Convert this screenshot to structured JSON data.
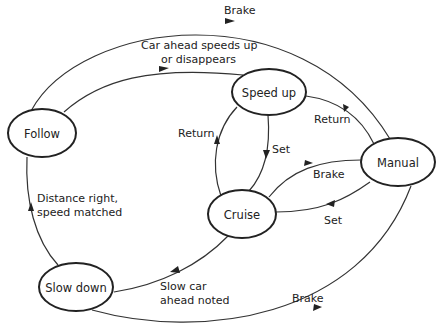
{
  "diagram": {
    "type": "state-transition",
    "nodes": {
      "follow": {
        "label": "Follow"
      },
      "speed_up": {
        "label": "Speed up"
      },
      "manual": {
        "label": "Manual"
      },
      "cruise": {
        "label": "Cruise"
      },
      "slow_down": {
        "label": "Slow down"
      }
    },
    "edges": {
      "follow_to_manual": {
        "label": "Brake"
      },
      "follow_to_speed_up": {
        "label_line1": "Car ahead speeds up",
        "label_line2": "or disappears"
      },
      "manual_to_speed_up": {
        "label": "Return"
      },
      "speed_up_to_cruise": {
        "label": "Set"
      },
      "cruise_to_speed_up": {
        "label": "Return"
      },
      "cruise_to_manual": {
        "label": "Brake"
      },
      "manual_to_cruise": {
        "label": "Set"
      },
      "slow_down_to_follow": {
        "label_line1": "Distance right,",
        "label_line2": "speed matched"
      },
      "cruise_to_slow_down": {
        "label_line1": "Slow car",
        "label_line2": "ahead noted"
      },
      "slow_down_to_manual": {
        "label": "Brake"
      }
    }
  }
}
